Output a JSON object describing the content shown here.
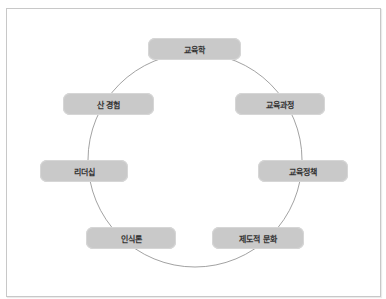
{
  "diagram": {
    "type": "cycle",
    "center": "",
    "nodes": [
      {
        "id": "top",
        "label": "교육학"
      },
      {
        "id": "upper-right",
        "label": "교육과정"
      },
      {
        "id": "right",
        "label": "교육정책"
      },
      {
        "id": "lower-right",
        "label": "제도적 문화"
      },
      {
        "id": "lower-left",
        "label": "인식론"
      },
      {
        "id": "left",
        "label": "리더십"
      },
      {
        "id": "upper-left",
        "label": "산 경험"
      }
    ],
    "colors": {
      "node_fill": "#c9c9c9",
      "node_text": "#333333",
      "ring_stroke": "#8a8a8a",
      "frame_border": "#c8c8c8"
    }
  }
}
